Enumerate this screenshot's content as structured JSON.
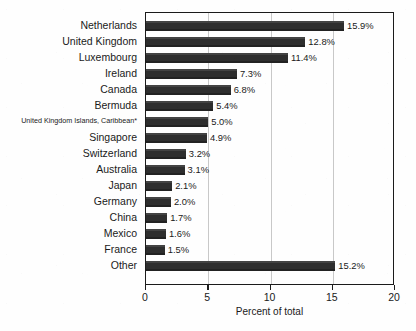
{
  "chart_data": {
    "type": "bar",
    "orientation": "horizontal",
    "title": "",
    "xlabel": "Percent of total",
    "ylabel": "",
    "xlim": [
      0,
      20
    ],
    "xticks": [
      0,
      5,
      10,
      15,
      20
    ],
    "xtick_labels": [
      "0",
      "5",
      "10",
      "15",
      "20"
    ],
    "grid": true,
    "gridlines_at": [
      5,
      10,
      15
    ],
    "legend": null,
    "categories": [
      "Netherlands",
      "United Kingdom",
      "Luxembourg",
      "Ireland",
      "Canada",
      "Bermuda",
      "United Kingdom Islands, Caribbean*",
      "Singapore",
      "Switzerland",
      "Australia",
      "Japan",
      "Germany",
      "China",
      "Mexico",
      "France",
      "Other"
    ],
    "values": [
      15.9,
      12.8,
      11.4,
      7.3,
      6.8,
      5.4,
      5.0,
      4.9,
      3.2,
      3.1,
      2.1,
      2.0,
      1.7,
      1.6,
      1.5,
      15.2
    ],
    "value_labels": [
      "15.9%",
      "12.8%",
      "11.4%",
      "7.3%",
      "6.8%",
      "5.4%",
      "5.0%",
      "4.9%",
      "3.2%",
      "3.1%",
      "2.1%",
      "2.0%",
      "1.7%",
      "1.6%",
      "1.5%",
      "15.2%"
    ],
    "bar_color": "#2e2e2e",
    "axis_color": "#1b1b1b",
    "grid_color": "#c8c8c8"
  }
}
